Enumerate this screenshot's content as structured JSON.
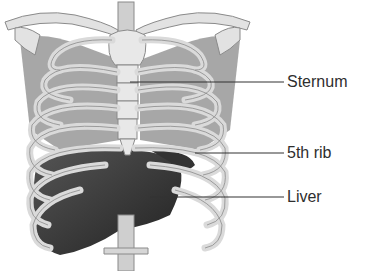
{
  "diagram": {
    "labels": [
      {
        "text": "Sternum",
        "x": 287,
        "y": 73,
        "pointer_from": [
          130,
          82
        ],
        "pointer_to": [
          283,
          82
        ]
      },
      {
        "text": "5th rib",
        "x": 287,
        "y": 144,
        "pointer_from": [
          195,
          153
        ],
        "pointer_to": [
          283,
          153
        ]
      },
      {
        "text": "Liver",
        "x": 287,
        "y": 188,
        "pointer_from": [
          150,
          197
        ],
        "pointer_to": [
          283,
          197
        ]
      }
    ],
    "colors": {
      "bone": "#dcdcdc",
      "bone_outline": "#8a8a8a",
      "liver": "#3a3a3a",
      "muscle": "#7a7a7a",
      "text": "#2e2e2e",
      "leader_line": "#333333"
    }
  }
}
